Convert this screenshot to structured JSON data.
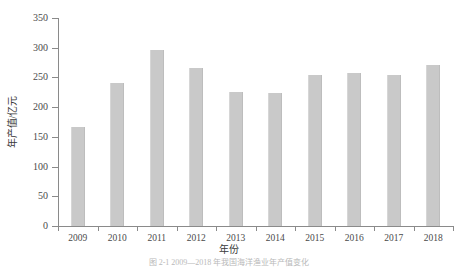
{
  "chart_data": {
    "type": "bar",
    "title": "",
    "xlabel": "年份",
    "ylabel": "年产值/亿元",
    "categories": [
      "2009",
      "2010",
      "2011",
      "2012",
      "2013",
      "2014",
      "2015",
      "2016",
      "2017",
      "2018"
    ],
    "values": [
      167,
      241,
      297,
      266,
      225,
      223,
      254,
      258,
      254,
      271
    ],
    "ylim": [
      0,
      350
    ],
    "yticks": [
      0,
      50,
      100,
      150,
      200,
      250,
      300,
      350
    ],
    "ytick_labels": [
      "0",
      "50",
      "100",
      "150",
      "200",
      "250",
      "300",
      "350"
    ],
    "grid": false,
    "legend": null,
    "bar_color": "#c9c9c9",
    "axis_color": "#8a8a8a"
  },
  "figure": {
    "caption": "图 2-1  2009—2018 年我国海洋渔业年产值变化"
  }
}
